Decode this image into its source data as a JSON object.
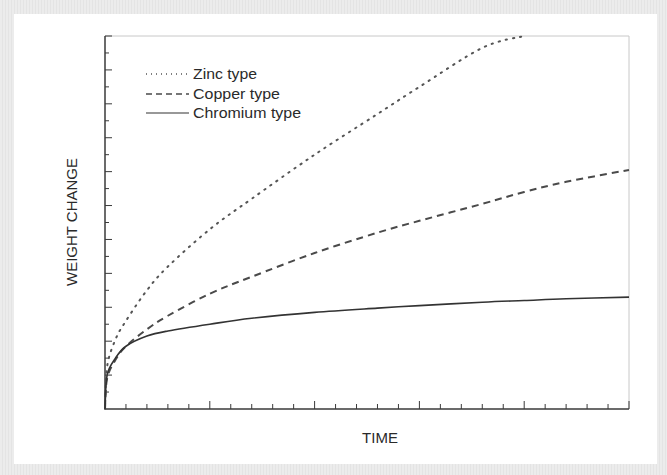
{
  "chart_data": {
    "type": "line",
    "title": "",
    "xlabel": "TIME",
    "ylabel": "WEIGHT CHANGE",
    "xlim": [
      0,
      25
    ],
    "ylim": [
      0,
      22
    ],
    "grid": false,
    "x_ticks": {
      "minor_count": 25,
      "major_every": 5,
      "labels": []
    },
    "y_ticks": {
      "minor_count": 22,
      "major_every": 2,
      "labels": []
    },
    "legend": {
      "position": "upper-left",
      "entries": [
        {
          "label": "Zinc type",
          "style": "dotted"
        },
        {
          "label": "Copper type",
          "style": "dashed"
        },
        {
          "label": "Chromium type",
          "style": "solid"
        }
      ]
    },
    "x": [
      0,
      0.1,
      0.5,
      1,
      2,
      3,
      5,
      7,
      10,
      13,
      15,
      18,
      20,
      22,
      25
    ],
    "series": [
      {
        "name": "Zinc type",
        "style": "dotted",
        "color": "#555555",
        "values": [
          0,
          2.5,
          4.1,
          5.2,
          7.0,
          8.4,
          10.6,
          12.4,
          15.0,
          17.4,
          19.0,
          21.3,
          22.0,
          null,
          null
        ]
      },
      {
        "name": "Copper type",
        "style": "dashed",
        "color": "#4a4a4a",
        "values": [
          0,
          1.8,
          2.9,
          3.7,
          4.7,
          5.5,
          6.8,
          7.8,
          9.2,
          10.4,
          11.1,
          12.1,
          12.8,
          13.4,
          14.1
        ]
      },
      {
        "name": "Chromium type",
        "style": "solid",
        "color": "#333333",
        "values": [
          0,
          2.0,
          3.0,
          3.7,
          4.3,
          4.6,
          5.0,
          5.35,
          5.7,
          5.95,
          6.1,
          6.3,
          6.4,
          6.5,
          6.6
        ]
      }
    ]
  },
  "axes": {
    "x_label": "TIME",
    "y_label": "WEIGHT CHANGE"
  },
  "legend": {
    "zinc": "Zinc type",
    "copper": "Copper type",
    "chromium": "Chromium type"
  },
  "colors": {
    "axis": "#3a3a3a",
    "frame": "#c8c8c8",
    "panel": "#ffffff",
    "border": "#e9e9e9"
  }
}
